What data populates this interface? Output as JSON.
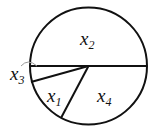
{
  "diagram": {
    "type": "circle-partition",
    "stroke_color": "#111111",
    "marker_color": "#999999",
    "circle": {
      "cx": 88.5,
      "cy": 66,
      "r": 58.5
    },
    "segments": [
      {
        "name": "horizontal-diameter",
        "x1": 30,
        "y1": 66,
        "x2": 147,
        "y2": 66
      },
      {
        "name": "radius-to-left-lower",
        "x1": 88.5,
        "y1": 66,
        "x2": 31,
        "y2": 82
      },
      {
        "name": "radius-to-bottom",
        "x1": 88.5,
        "y1": 66,
        "x2": 61,
        "y2": 118
      }
    ],
    "labels": [
      {
        "id": "x2",
        "base": "x",
        "sub": "2",
        "left": 80,
        "top": 29
      },
      {
        "id": "x3",
        "base": "x",
        "sub": "3",
        "left": 10,
        "top": 64
      },
      {
        "id": "x1",
        "base": "x",
        "sub": "1",
        "left": 47,
        "top": 86
      },
      {
        "id": "x4",
        "base": "x",
        "sub": "4",
        "left": 97,
        "top": 86
      }
    ]
  }
}
